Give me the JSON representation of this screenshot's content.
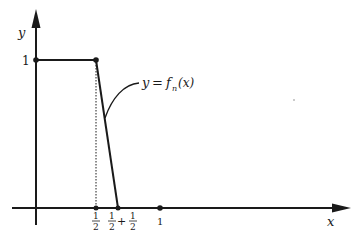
{
  "diagram": {
    "type": "function-graph",
    "axes": {
      "x_label": "x",
      "y_label": "y"
    },
    "y_tick": {
      "label": "1"
    },
    "x_ticks": [
      {
        "num": "1",
        "den": "2",
        "suffix": ""
      },
      {
        "num": "1",
        "den": "2",
        "plus": "+",
        "num2": "1",
        "den2": "2"
      },
      {
        "label": "1"
      }
    ],
    "function_label": {
      "lhs": "y",
      "eq": "=",
      "f": "f",
      "sub": "n",
      "arg": "(x)"
    },
    "points": [
      {
        "name": "(0,1)",
        "x": 0,
        "y": 1
      },
      {
        "name": "(1/2,1)",
        "x": 0.5,
        "y": 1
      },
      {
        "name": "(1/2+1/n,0)",
        "x": "1/2+1/n",
        "y": 0
      },
      {
        "name": "(1/2,0)",
        "x": 0.5,
        "y": 0
      },
      {
        "name": "(1,0)",
        "x": 1,
        "y": 0
      }
    ],
    "colors": {
      "ink": "#1a1a1a",
      "background": "#ffffff"
    }
  }
}
